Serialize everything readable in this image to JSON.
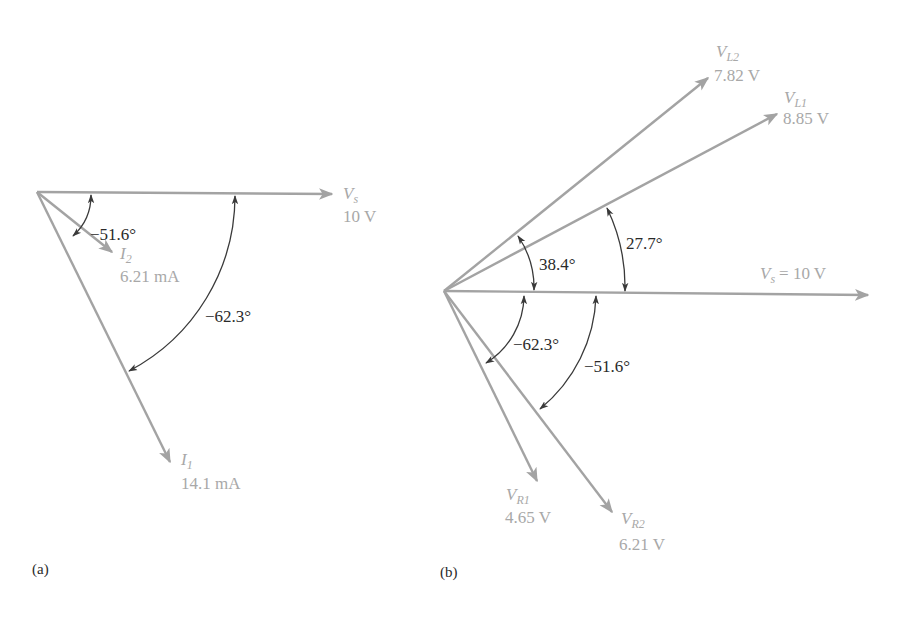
{
  "panels": [
    {
      "id": "a",
      "caption": "(a)",
      "vectors": [
        {
          "name": "Vs",
          "symbol": "V",
          "subscript": "s",
          "value": "10 V"
        },
        {
          "name": "I2",
          "symbol": "I",
          "subscript": "2",
          "value": "6.21 mA"
        },
        {
          "name": "I1",
          "symbol": "I",
          "subscript": "1",
          "value": "14.1 mA"
        }
      ],
      "angles": [
        {
          "between": [
            "Vs",
            "I2"
          ],
          "label": "−51.6°"
        },
        {
          "between": [
            "Vs",
            "I1"
          ],
          "label": "−62.3°"
        }
      ]
    },
    {
      "id": "b",
      "caption": "(b)",
      "vectors": [
        {
          "name": "VL2",
          "symbol": "V",
          "subscript": "L2",
          "value": "7.82 V"
        },
        {
          "name": "VL1",
          "symbol": "V",
          "subscript": "L1",
          "value": "8.85 V"
        },
        {
          "name": "Vs",
          "symbol": "V",
          "subscript": "s",
          "value": "= 10 V"
        },
        {
          "name": "VR1",
          "symbol": "V",
          "subscript": "R1",
          "value": "4.65 V"
        },
        {
          "name": "VR2",
          "symbol": "V",
          "subscript": "R2",
          "value": "6.21 V"
        }
      ],
      "angles": [
        {
          "between": [
            "Vs",
            "VL2"
          ],
          "label": "38.4°"
        },
        {
          "between": [
            "Vs",
            "VL1"
          ],
          "label": "27.7°"
        },
        {
          "between": [
            "Vs",
            "VR1"
          ],
          "label": "−62.3°"
        },
        {
          "between": [
            "Vs",
            "VR2"
          ],
          "label": "−51.6°"
        }
      ]
    }
  ],
  "colors": {
    "vector": "#a3a3a3",
    "arc": "#3a3a3a",
    "vector_label": "#a8a8a8",
    "angle_label": "#2a2a2a"
  }
}
